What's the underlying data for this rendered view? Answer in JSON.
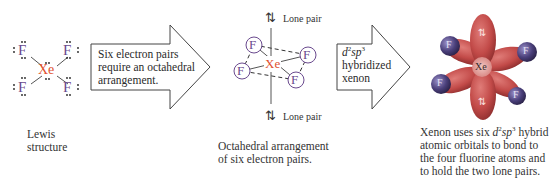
{
  "colors": {
    "fluorine": "#6a4a8e",
    "xenon": "#e0502e",
    "orbital_red": "#c24a48",
    "atom_purple": "#4a3f7a",
    "text": "#2a2a2a"
  },
  "lewis": {
    "atoms": [
      "F",
      "F",
      "F",
      "F"
    ],
    "center": "Xe",
    "caption_line1": "Lewis",
    "caption_line2": "structure"
  },
  "arrow1": {
    "line1": "Six electron pairs",
    "line2": "require an octahedral",
    "line3": "arrangement."
  },
  "octahedral": {
    "center": "Xe",
    "ligand": "F",
    "lone_pair_top": "Lone pair",
    "lone_pair_bottom": "Lone pair",
    "lone_pair_symbol": "⇅",
    "caption_line1": "Octahedral arrangement",
    "caption_line2": "of six electron pairs."
  },
  "arrow2": {
    "d": "d",
    "d_sup": "2",
    "sp": "sp",
    "sp_sup": "3",
    "line2": "hybridized",
    "line3": "xenon"
  },
  "orbital_model": {
    "center": "Xe",
    "ligand": "F",
    "lone_pair_symbol": "⇅",
    "caption": {
      "l1_pre": "Xenon uses six ",
      "d": "d",
      "d_sup": "2",
      "sp": "sp",
      "sp_sup": "3",
      "l1_post": " hybrid",
      "line2": "atomic orbitals to bond to",
      "line3": "the four fluorine atoms and",
      "line4": "to hold the two lone pairs."
    }
  }
}
